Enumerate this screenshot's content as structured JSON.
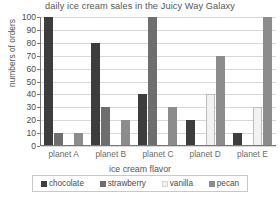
{
  "chart_data": {
    "type": "bar",
    "title": "daily ice cream sales in the Juicy Way Galaxy",
    "xlabel": "ice cream flavor",
    "ylabel": "numbers of orders",
    "categories": [
      "planet A",
      "planet B",
      "planet C",
      "planet D",
      "planet E"
    ],
    "series": [
      {
        "name": "chocolate",
        "color": "#3d3d3d",
        "values": [
          100,
          80,
          40,
          20,
          10
        ]
      },
      {
        "name": "strawberry",
        "color": "#6e6e6e",
        "values": [
          10,
          30,
          100,
          0,
          0
        ]
      },
      {
        "name": "vanilla",
        "color": "#f2f2f2",
        "values": [
          0,
          0,
          0,
          40,
          30
        ]
      },
      {
        "name": "pecan",
        "color": "#8c8c8c",
        "values": [
          10,
          20,
          30,
          70,
          100
        ]
      }
    ],
    "ylim": [
      0,
      100
    ],
    "yticks": [
      0,
      10,
      20,
      30,
      40,
      50,
      60,
      70,
      80,
      90,
      100
    ],
    "grid": true,
    "legend_position": "bottom",
    "legend_title": "ice cream flavor"
  }
}
